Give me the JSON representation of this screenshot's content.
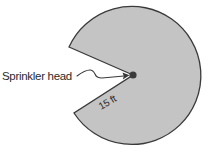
{
  "diagram": {
    "colors": {
      "sector_fill": "#c4c4c4",
      "sector_stroke": "#3a3a3a",
      "dot": "#3a3a3a",
      "text": "#2a2a2a",
      "background": "#ffffff"
    },
    "labels": {
      "sprinkler_head": "Sprinkler head",
      "radius": "15 ft"
    },
    "geometry": {
      "center": [
        133,
        75
      ],
      "radius_px": 69,
      "radius_value": "15 ft",
      "wedge_opening": "missing sector on left side"
    }
  }
}
